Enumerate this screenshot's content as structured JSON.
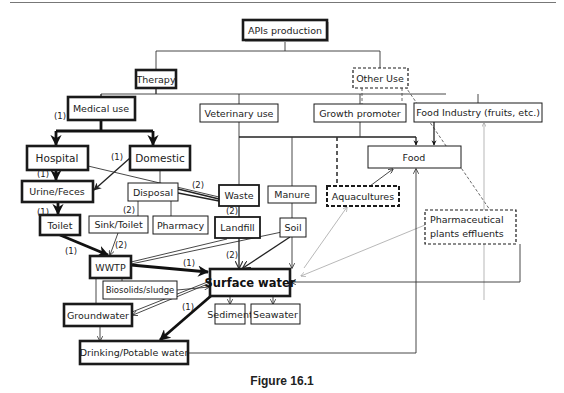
{
  "figure": {
    "caption": "Figure 16.1"
  },
  "nodes": {
    "apis_production": "APIs production",
    "therapy": "Therapy",
    "other_use": "Other Use",
    "medical_use": "Medical use",
    "veterinary_use": "Veterinary use",
    "growth_promoter": "Growth promoter",
    "food_industry": "Food Industry (fruits, etc.)",
    "hospital": "Hospital",
    "domestic": "Domestic",
    "food": "Food",
    "urine_feces": "Urine/Feces",
    "disposal": "Disposal",
    "waste": "Waste",
    "manure": "Manure",
    "aquacultures": "Aquacultures",
    "pharma_effluents_line1": "Pharmaceutical",
    "pharma_effluents_line2": "plants effluents",
    "toilet": "Toilet",
    "sink_toilet": "Sink/Toilet",
    "pharmacy": "Pharmacy",
    "landfill": "Landfill",
    "soil": "Soil",
    "wwtp": "WWTP",
    "biosolids_sludge": "Biosolids/sludge",
    "surface_water": "Surface water",
    "groundwater": "Groundwater",
    "sediment": "Sediment",
    "seawater": "Seawater",
    "drinking_water": "Drinking/Potable water"
  },
  "annotations": {
    "medical_use": "(1)",
    "domestic_to_urine": "(1)",
    "hospital_to_urine": "(1)",
    "urine_to_toilet": "(1)",
    "toilet_to_wwtp": "(1)",
    "disposal_to_waste": "(2)",
    "disposal_to_sink": "(2)",
    "sink_to_wwtp": "(2)",
    "waste_to_landfill": "(2)",
    "landfill_to_surface": "(2)",
    "wwtp_to_surface": "(1)",
    "surface_to_drinking": "(1)"
  }
}
